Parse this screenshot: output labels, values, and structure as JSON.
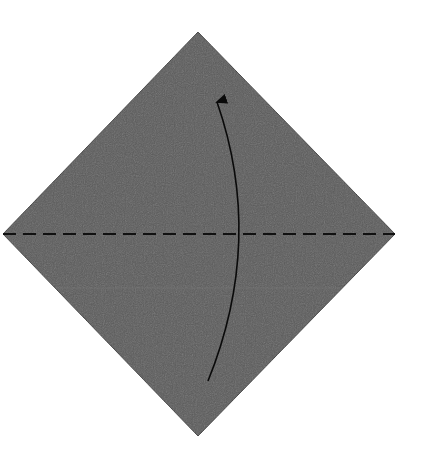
{
  "diagram": {
    "type": "origami-fold-step",
    "paper": {
      "shape": "square-diamond",
      "color": "#5b5b5b",
      "edge_color": "#3a3a3a",
      "vertices": {
        "top": [
          198,
          32
        ],
        "right": [
          395,
          234
        ],
        "bottom": [
          198,
          436
        ],
        "left": [
          3,
          234
        ]
      }
    },
    "fold_line": {
      "kind": "valley-fold",
      "style": "dashed",
      "color": "#111111",
      "from": [
        3,
        234
      ],
      "to": [
        395,
        234
      ]
    },
    "arrow": {
      "meaning": "fold-bottom-up",
      "color": "#0a0a0a",
      "start": [
        208,
        381
      ],
      "control": [
        265,
        240
      ],
      "end": [
        217,
        102
      ]
    },
    "faint_line": {
      "color": "#7a7a7a",
      "y": 288
    }
  }
}
